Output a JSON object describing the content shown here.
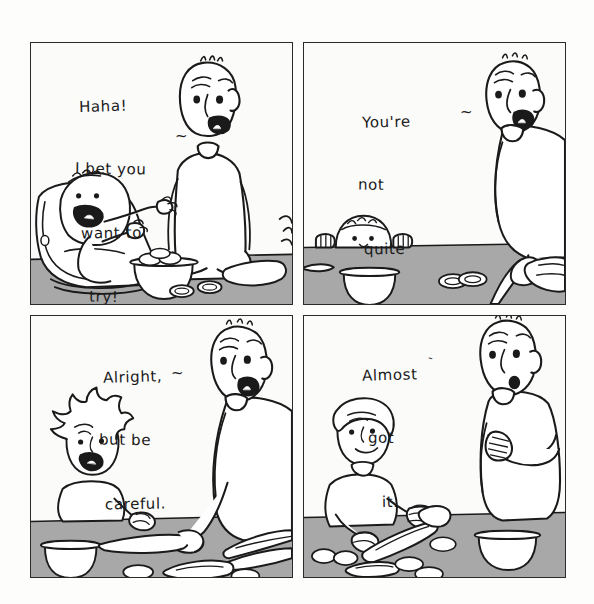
{
  "comic": {
    "title": "Four-panel comic: child learning to cut food at the kitchen counter",
    "layout": "2x2",
    "background_color": "#fdfdfc",
    "panel_border_color": "#2a2a2a",
    "counter_color": "#a8a8a8",
    "ink_color": "#1a1a1a",
    "fill_color": "#ffffff",
    "panels": [
      {
        "id": "panel-1",
        "position": "top-left",
        "dialogue_lines": [
          "Haha!",
          "I bet you",
          "want to",
          "try!"
        ],
        "dialogue_tail": "~",
        "characters": [
          "adult-parent",
          "baby-in-bouncer"
        ],
        "props": [
          "bowl-of-eggs",
          "sliced-food",
          "cutting-hands"
        ]
      },
      {
        "id": "panel-2",
        "position": "top-right",
        "dialogue_lines": [
          "You're",
          "not",
          "quite",
          "ready",
          "yet."
        ],
        "dialogue_tail": "~",
        "characters": [
          "adult-parent",
          "toddler-peeking"
        ],
        "props": [
          "bowl",
          "sliced-food",
          "knife",
          "loaf"
        ]
      },
      {
        "id": "panel-3",
        "position": "bottom-left",
        "dialogue_lines": [
          "Alright,",
          "but be",
          "careful."
        ],
        "dialogue_tail": "~",
        "characters": [
          "adult-parent",
          "child-with-spiky-hair"
        ],
        "props": [
          "bowl",
          "knife",
          "carrot",
          "sliced-food"
        ]
      },
      {
        "id": "panel-4",
        "position": "bottom-right",
        "dialogue_lines": [
          "Almost",
          "got",
          "it."
        ],
        "dialogue_tail": "`",
        "characters": [
          "adult-parent-arms-crossed",
          "older-child-cutting"
        ],
        "props": [
          "bowl",
          "knife",
          "carrot",
          "sliced-food"
        ]
      }
    ]
  }
}
